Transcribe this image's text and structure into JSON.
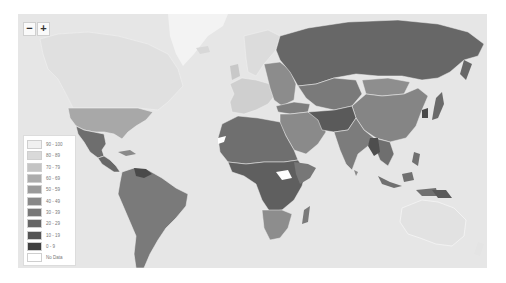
{
  "map": {
    "type": "choropleth",
    "theme": "grayscale",
    "ocean_color": "#e6e6e6",
    "border_color": "#f2f2f2"
  },
  "zoom_controls": {
    "zoom_out_label": "−",
    "zoom_in_label": "+"
  },
  "legend": {
    "items": [
      {
        "label": "90 - 100",
        "color": "#f0f0f0"
      },
      {
        "label": "80 - 89",
        "color": "#d9d9d9"
      },
      {
        "label": "70 - 79",
        "color": "#c4c4c4"
      },
      {
        "label": "60 - 69",
        "color": "#acacac"
      },
      {
        "label": "50 - 59",
        "color": "#9a9a9a"
      },
      {
        "label": "40 - 49",
        "color": "#888888"
      },
      {
        "label": "30 - 39",
        "color": "#777777"
      },
      {
        "label": "20 - 29",
        "color": "#666666"
      },
      {
        "label": "10 - 19",
        "color": "#545454"
      },
      {
        "label": "0 - 9",
        "color": "#404040"
      },
      {
        "label": "No Data",
        "color": "#ffffff"
      }
    ]
  },
  "regions": {
    "greenland": "#f4f4f4",
    "canada": "#e4e4e4",
    "usa": "#a9a9a9",
    "mexico": "#6e6e6e",
    "central_america": "#6a6a6a",
    "south_america": "#7a7a7a",
    "venezuela": "#4a4a4a",
    "europe_west": "#d0d0d0",
    "europe_east": "#8c8c8c",
    "russia": "#686868",
    "china": "#858585",
    "india": "#7c7c7c",
    "middle_east": "#8a8a8a",
    "africa_north": "#6f6f6f",
    "africa_central": "#5f5f5f",
    "south_sudan": "#ffffff",
    "africa_south": "#8d8d8d",
    "southeast_asia": "#707070",
    "australia": "#e2e2e2",
    "japan": "#6a6a6a"
  }
}
